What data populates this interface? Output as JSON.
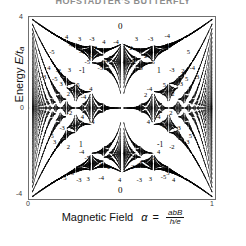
{
  "figure": {
    "title": "HOFSTADTER'S BUTTERFLY",
    "kind": "hofstadter-butterfly-spectrum"
  },
  "axes": {
    "y": {
      "label_text": "Energy",
      "label_symbol": "E/t",
      "label_subscript": "a",
      "ticks": [
        {
          "value": "4",
          "position": "top"
        },
        {
          "value": "0",
          "position": "middle"
        },
        {
          "value": "-4",
          "position": "bottom"
        }
      ]
    },
    "x": {
      "label_text": "Magnetic Field",
      "label_symbol": "α",
      "label_equals": "=",
      "fraction_numerator": "abB",
      "fraction_denominator": "h/e",
      "ticks": [
        {
          "value": "0",
          "position": "left"
        },
        {
          "value": "1",
          "position": "right"
        }
      ]
    }
  },
  "chart_data": {
    "type": "scatter",
    "title": "HOFSTADTER'S BUTTERFLY",
    "xlabel": "Magnetic Field  α = abB/(h/e)",
    "ylabel": "Energy E/t_a",
    "xlim": [
      0,
      1
    ],
    "ylim": [
      -4,
      4
    ],
    "xticks": [
      0,
      1
    ],
    "xticklabels": [
      "0",
      "1"
    ],
    "yticks": [
      -4,
      0,
      4
    ],
    "yticklabels": [
      "-4",
      "0",
      "4"
    ],
    "grid": false,
    "legend": null,
    "gap_labels": [
      {
        "text": "0",
        "x": 0.5,
        "y": 3.62
      },
      {
        "text": "0",
        "x": 0.5,
        "y": -3.62
      },
      {
        "text": "-1",
        "x": 0.29,
        "y": 1.62
      },
      {
        "text": "1",
        "x": 0.71,
        "y": 1.62
      },
      {
        "text": "1",
        "x": 0.29,
        "y": -1.62
      },
      {
        "text": "-1",
        "x": 0.71,
        "y": -1.62
      },
      {
        "text": "4",
        "x": 0.215,
        "y": 3.08
      },
      {
        "text": "3",
        "x": 0.285,
        "y": 3.0
      },
      {
        "text": "-3",
        "x": 0.345,
        "y": 3.0
      },
      {
        "text": "4",
        "x": 0.415,
        "y": 2.84
      },
      {
        "text": "-4",
        "x": 0.475,
        "y": 2.86
      },
      {
        "text": "3",
        "x": 0.59,
        "y": 3.0
      },
      {
        "text": "-3",
        "x": 0.66,
        "y": 3.0
      },
      {
        "text": "-4",
        "x": 0.75,
        "y": 3.12
      },
      {
        "text": "-5",
        "x": 0.235,
        "y": 2.72
      },
      {
        "text": "2",
        "x": 0.37,
        "y": 2.58
      },
      {
        "text": "2",
        "x": 0.56,
        "y": 2.58
      },
      {
        "text": "5",
        "x": 0.755,
        "y": 2.7
      },
      {
        "text": "-4",
        "x": 0.29,
        "y": 2.4
      },
      {
        "text": "-2",
        "x": 0.345,
        "y": 2.24
      },
      {
        "text": "2",
        "x": 0.64,
        "y": 2.24
      },
      {
        "text": "4",
        "x": 0.705,
        "y": 2.4
      },
      {
        "text": "-5",
        "x": 0.32,
        "y": 2.0
      },
      {
        "text": "-4",
        "x": 0.42,
        "y": 2.04
      },
      {
        "text": "4",
        "x": 0.575,
        "y": 2.04
      },
      {
        "text": "5",
        "x": 0.68,
        "y": 2.0
      },
      {
        "text": "-5",
        "x": 0.39,
        "y": 1.7
      },
      {
        "text": "5",
        "x": 0.615,
        "y": 1.7
      },
      {
        "text": "-5",
        "x": 0.13,
        "y": 2.4
      },
      {
        "text": "5",
        "x": 0.87,
        "y": 2.4
      },
      {
        "text": "4",
        "x": 0.12,
        "y": 1.7
      },
      {
        "text": "-2",
        "x": 0.165,
        "y": 1.58
      },
      {
        "text": "3",
        "x": 0.23,
        "y": 1.62
      },
      {
        "text": "-3",
        "x": 0.775,
        "y": 1.62
      },
      {
        "text": "2",
        "x": 0.84,
        "y": 1.58
      },
      {
        "text": "-4",
        "x": 0.885,
        "y": 1.7
      },
      {
        "text": "-3",
        "x": 0.085,
        "y": 1.32
      },
      {
        "text": "-5",
        "x": 0.145,
        "y": 1.22
      },
      {
        "text": "5",
        "x": 0.86,
        "y": 1.22
      },
      {
        "text": "3",
        "x": 0.92,
        "y": 1.32
      },
      {
        "text": "3",
        "x": 0.185,
        "y": 1.02
      },
      {
        "text": "-5",
        "x": 0.265,
        "y": 0.98
      },
      {
        "text": "5",
        "x": 0.74,
        "y": 0.98
      },
      {
        "text": "-3",
        "x": 0.82,
        "y": 1.02
      },
      {
        "text": "4",
        "x": 0.345,
        "y": 0.8
      },
      {
        "text": "-4",
        "x": 0.655,
        "y": 0.8
      },
      {
        "text": "2",
        "x": 0.225,
        "y": 0.56
      },
      {
        "text": "-2",
        "x": 0.775,
        "y": 0.56
      },
      {
        "text": "-4",
        "x": 0.3,
        "y": 0.44
      },
      {
        "text": "2",
        "x": 0.64,
        "y": 0.52
      },
      {
        "text": "-2",
        "x": 0.225,
        "y": -0.26
      },
      {
        "text": "2",
        "x": 0.775,
        "y": -0.26
      },
      {
        "text": "4",
        "x": 0.3,
        "y": -0.42
      },
      {
        "text": "-4",
        "x": 0.7,
        "y": -0.42
      },
      {
        "text": "-4",
        "x": 0.345,
        "y": -0.66
      },
      {
        "text": "4",
        "x": 0.655,
        "y": -0.66
      },
      {
        "text": "-3",
        "x": 0.185,
        "y": -0.92
      },
      {
        "text": "5",
        "x": 0.265,
        "y": -0.88
      },
      {
        "text": "-5",
        "x": 0.74,
        "y": -0.88
      },
      {
        "text": "3",
        "x": 0.82,
        "y": -0.92
      },
      {
        "text": "-5",
        "x": 0.125,
        "y": -1.26
      },
      {
        "text": "3",
        "x": 0.15,
        "y": -1.52
      },
      {
        "text": "-3",
        "x": 0.855,
        "y": -1.52
      },
      {
        "text": "5",
        "x": 0.88,
        "y": -1.26
      },
      {
        "text": "2",
        "x": 0.225,
        "y": -1.78
      },
      {
        "text": "-2",
        "x": 0.775,
        "y": -1.78
      },
      {
        "text": "-4",
        "x": 0.29,
        "y": -1.96
      },
      {
        "text": "4",
        "x": 0.71,
        "y": -1.96
      },
      {
        "text": "-5",
        "x": 0.32,
        "y": -2.22
      },
      {
        "text": "5",
        "x": 0.68,
        "y": -2.22
      },
      {
        "text": "5",
        "x": 0.395,
        "y": -2.48
      },
      {
        "text": "-5",
        "x": 0.605,
        "y": -2.48
      },
      {
        "text": "-2",
        "x": 0.43,
        "y": -2.62
      },
      {
        "text": "2",
        "x": 0.57,
        "y": -2.62
      },
      {
        "text": "-5",
        "x": 0.235,
        "y": -2.92
      },
      {
        "text": "5",
        "x": 0.76,
        "y": -2.92
      },
      {
        "text": "5",
        "x": 0.205,
        "y": -3.1
      },
      {
        "text": "-3",
        "x": 0.275,
        "y": -3.22
      },
      {
        "text": "3",
        "x": 0.33,
        "y": -3.18
      },
      {
        "text": "-4",
        "x": 0.395,
        "y": -3.14
      },
      {
        "text": "4",
        "x": 0.5,
        "y": -3.22
      },
      {
        "text": "-3",
        "x": 0.6,
        "y": -3.22
      },
      {
        "text": "3",
        "x": 0.665,
        "y": -3.18
      },
      {
        "text": "-5",
        "x": 0.73,
        "y": -3.08
      },
      {
        "text": "4",
        "x": 0.79,
        "y": -3.22
      }
    ]
  },
  "colors": {
    "background": "#ffffff",
    "ink": "#1a1a1a",
    "frame": "#6f6f6f",
    "title": "#8d8d8d"
  }
}
